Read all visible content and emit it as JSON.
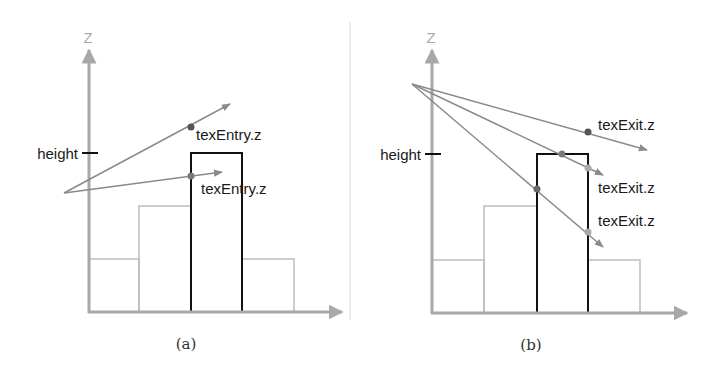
{
  "colors": {
    "axis": "#a8a8a8",
    "bar_outline": "#bdbdbd",
    "highlight_bar": "#111111",
    "ray": "#8a8a8a",
    "dot_dark": "#555555",
    "dot_mid": "#7a7a7a",
    "dot_light": "#aaaaaa",
    "label": "#1a1a1a",
    "axis_label": "#aaaaaa",
    "separator": "#dcdcdc"
  },
  "panel_a": {
    "axis_label": "Z",
    "height_label": "height",
    "caption": "(a)",
    "labels": [
      "texEntry.z",
      "texEntry.z"
    ]
  },
  "panel_b": {
    "axis_label": "Z",
    "height_label": "height",
    "caption": "(b)",
    "labels": [
      "texExit.z",
      "texExit.z",
      "texExit.z"
    ]
  }
}
